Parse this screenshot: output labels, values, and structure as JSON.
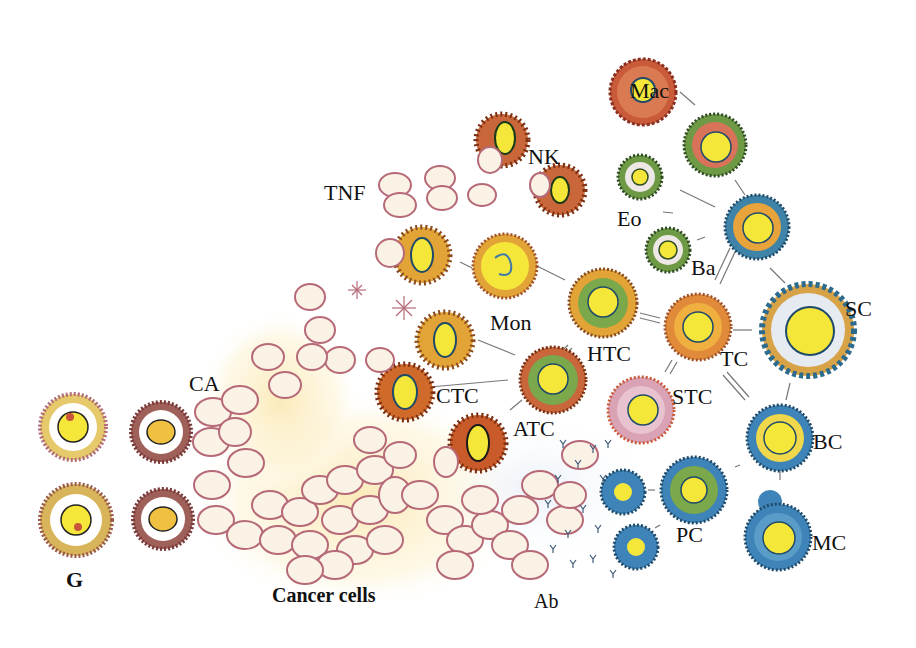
{
  "diagram": {
    "labels": {
      "mac": "Mac",
      "nk": "NK",
      "tnf": "TNF",
      "eo": "Eo",
      "ba": "Ba",
      "mon": "Mon",
      "sc": "SC",
      "htc": "HTC",
      "tc": "TC",
      "ctc": "CTC",
      "ca": "CA",
      "stc": "STC",
      "atc": "ATC",
      "bc": "BC",
      "pc": "PC",
      "mc": "MC",
      "g": "G",
      "cancer_cells": "Cancer cells",
      "ab": "Ab"
    },
    "colors": {
      "nucleus_yellow": "#f5e63a",
      "orange_ring": "#e8a33a",
      "red_ring": "#c9553a",
      "green_ring": "#7aa84a",
      "blue_ring": "#3f84b8",
      "pink_ring": "#d9a2b5",
      "rbc_outline": "#b66a78",
      "cancer_glow": "#fbefc6"
    }
  }
}
